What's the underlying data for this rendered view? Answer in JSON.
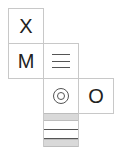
{
  "grid": {
    "cell_size_px": 35,
    "origin": {
      "x": 8,
      "y": 8
    },
    "cells": [
      {
        "id": "x",
        "row": 0,
        "col": 0,
        "label": "X",
        "kind": "letter"
      },
      {
        "id": "m",
        "row": 1,
        "col": 0,
        "label": "M",
        "kind": "letter"
      },
      {
        "id": "menu",
        "row": 1,
        "col": 1,
        "icon": "hamburger-menu-icon",
        "kind": "icon"
      },
      {
        "id": "target",
        "row": 2,
        "col": 1,
        "icon": "bullseye-icon",
        "kind": "icon"
      },
      {
        "id": "o",
        "row": 2,
        "col": 2,
        "label": "O",
        "kind": "letter"
      },
      {
        "id": "stripes",
        "row": 3,
        "col": 1,
        "icon": "striped-bands",
        "kind": "pattern"
      }
    ]
  },
  "colors": {
    "border": "#c8c8c8",
    "text": "#222222",
    "icon_stroke": "#555555",
    "band_gray": "#d9d9d9",
    "background": "#ffffff"
  }
}
